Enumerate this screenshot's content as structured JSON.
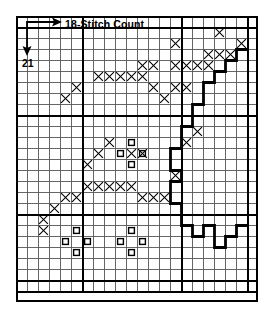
{
  "chart_data": {
    "type": "table",
    "title": "",
    "subtitle": "",
    "xlabel": "18-Stitch Count",
    "ylabel": "21",
    "grid": true,
    "legend_position": "none",
    "columns": 22,
    "rows": 25,
    "cell_px": 11,
    "heavy_gridline_columns": [
      0,
      6,
      15,
      21,
      22
    ],
    "heavy_gridline_rows": [
      0,
      1,
      9,
      18,
      24,
      25
    ],
    "symbols": {
      "cross": "X",
      "square": "open-square"
    },
    "cross_cells": [
      [
        1,
        18
      ],
      [
        2,
        14
      ],
      [
        2,
        20
      ],
      [
        3,
        17
      ],
      [
        3,
        18
      ],
      [
        3,
        19
      ],
      [
        4,
        11
      ],
      [
        4,
        12
      ],
      [
        4,
        14
      ],
      [
        4,
        15
      ],
      [
        4,
        16
      ],
      [
        4,
        17
      ],
      [
        5,
        7
      ],
      [
        5,
        8
      ],
      [
        5,
        9
      ],
      [
        5,
        10
      ],
      [
        5,
        11
      ],
      [
        6,
        5
      ],
      [
        6,
        12
      ],
      [
        6,
        14
      ],
      [
        6,
        15
      ],
      [
        7,
        4
      ],
      [
        7,
        13
      ],
      [
        10,
        16
      ],
      [
        11,
        8
      ],
      [
        11,
        15
      ],
      [
        12,
        7
      ],
      [
        12,
        10
      ],
      [
        12,
        11
      ],
      [
        13,
        6
      ],
      [
        14,
        14
      ],
      [
        15,
        6
      ],
      [
        15,
        7
      ],
      [
        15,
        8
      ],
      [
        15,
        9
      ],
      [
        15,
        10
      ],
      [
        16,
        4
      ],
      [
        16,
        5
      ],
      [
        16,
        11
      ],
      [
        16,
        12
      ],
      [
        16,
        13
      ],
      [
        17,
        3
      ],
      [
        18,
        2
      ],
      [
        19,
        2
      ]
    ],
    "square_cells": [
      [
        11,
        10
      ],
      [
        12,
        9
      ],
      [
        12,
        11
      ],
      [
        13,
        10
      ],
      [
        19,
        5
      ],
      [
        19,
        10
      ],
      [
        20,
        4
      ],
      [
        20,
        6
      ],
      [
        20,
        9
      ],
      [
        20,
        11
      ],
      [
        21,
        5
      ],
      [
        21,
        10
      ]
    ],
    "outline_path": "M 21,3 L 20,3 L 20,4 L 19,4 L 19,5 L 18,5 L 18,6 L 17,6 L 17,8 L 16,8 L 16,10 L 15,10 L 15,12 L 14,12 L 14,14 L 15,14 L 15,15 L 14,15 L 14,17 L 15,17 L 15,19 L 16,19 L 16,20 L 17,20 L 17,19 L 18,19 L 18,21 L 19,21 L 19,20 L 20,20 L 20,19 L 21,19",
    "colors": {
      "ink": "#000000",
      "grid_light": "#555555",
      "background": "#ffffff"
    }
  },
  "annotations": {
    "stitch_count": "18-Stitch Count",
    "row_count": "21",
    "stitch_arrow": "arrow-right-icon",
    "row_arrow": "arrow-down-icon"
  }
}
